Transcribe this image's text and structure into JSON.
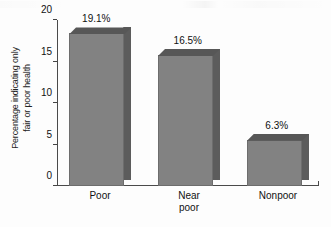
{
  "chart_data": {
    "type": "bar",
    "title": "",
    "subtitle": "",
    "xlabel": "",
    "ylabel_line1": "Percentage indicating only",
    "ylabel_line2": "fair or poor health",
    "categories": [
      "Poor",
      "Near poor",
      "Nonpoor"
    ],
    "category_lines": [
      [
        "Poor"
      ],
      [
        "Near",
        "poor"
      ],
      [
        "Nonpoor"
      ]
    ],
    "values": [
      19.1,
      16.5,
      6.3
    ],
    "value_labels": [
      "19.1%",
      "16.5%",
      "6.3%"
    ],
    "ylim": [
      0,
      20
    ],
    "yticks": [
      0,
      5,
      10,
      15,
      20
    ],
    "ytick_labels": [
      "0",
      "5",
      "10",
      "15",
      "20"
    ],
    "grid": false,
    "legend": false,
    "style": "3d-bars-grayscale",
    "colors": {
      "bar_front": "#828282",
      "bar_side": "#5c5c5c",
      "bar_top": "#575757",
      "bar_outline": "#6d6d6d",
      "axis": "#4a4a4a",
      "text": "#111111",
      "background": "#fdfdfd"
    }
  }
}
